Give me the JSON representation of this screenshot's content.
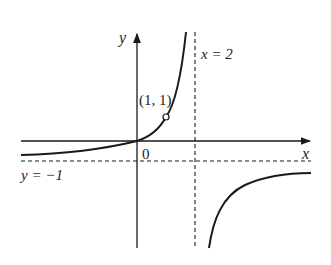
{
  "diagram": {
    "title": "",
    "axes": {
      "x_label": "x",
      "y_label": "y",
      "origin_label": "0"
    },
    "asymptotes": {
      "vertical": {
        "label": "x = 2",
        "value": 2
      },
      "horizontal": {
        "label": "y = −1",
        "value": -1
      }
    },
    "points": [
      {
        "label": "(1, 1)",
        "x": 1,
        "y": 1,
        "style": "open-circle"
      }
    ],
    "curve": "y = x/(2 - x)",
    "colors": {
      "stroke": "#1a1a1a",
      "background": "#ffffff"
    }
  }
}
